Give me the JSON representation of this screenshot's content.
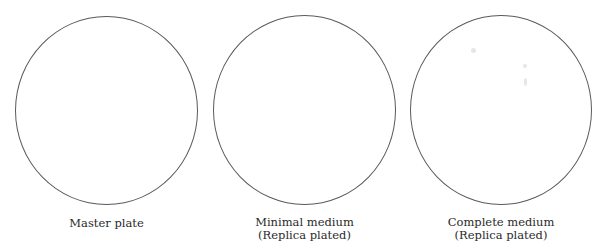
{
  "plates": [
    {
      "name": "master-plate",
      "label_line1": "Master plate",
      "label_line2": ""
    },
    {
      "name": "minimal-medium-plate",
      "label_line1": "Minimal medium",
      "label_line2": "(Replica plated)"
    },
    {
      "name": "complete-medium-plate",
      "label_line1": "Complete medium",
      "label_line2": "(Replica plated)"
    }
  ],
  "colors": {
    "plate_outline": "#5a5a5a",
    "label_text": "#2a2a2a",
    "background": "#ffffff"
  }
}
